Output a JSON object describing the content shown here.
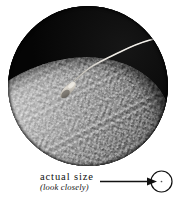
{
  "figure": {
    "name": "sperm-fertilizing-egg-micrograph",
    "alt_description": "Circular electron micrograph of a single spermatozoon with its head embedded in the granular surface of an ovum against a black background",
    "shape": "circular-vignette",
    "background_color": "#ffffff",
    "field_color": "#050505",
    "ovum_highlight_color": "#cfcfcf",
    "ovum_midtone_color": "#8e8e8e",
    "ovum_shadow_color": "#232323",
    "sperm_color": "#d8d4cc"
  },
  "annotation": {
    "primary_label": "actual size",
    "secondary_label": "(look closely)",
    "pointer": "arrow-right",
    "pointer_color": "#111111",
    "target_shape": "circle",
    "target_dot_label": "·"
  }
}
